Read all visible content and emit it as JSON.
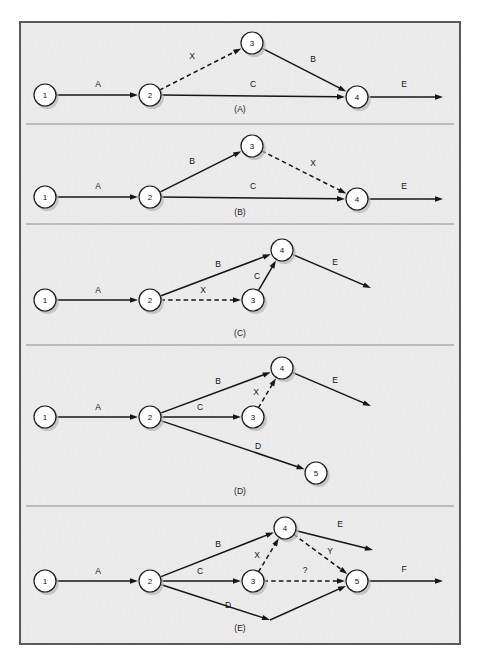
{
  "figure": {
    "background_color": "#ffffff",
    "frame": {
      "fill_color": "#ececec",
      "border_color": "#5a5a5a",
      "x": 20,
      "y": 22,
      "width": 440,
      "height": 622
    },
    "ink_color": "#161616",
    "node_fill_color": "#ffffff",
    "node_stroke_color": "#1c1c1c",
    "divider_color": "#8d8d8d",
    "node_radius": 11,
    "dividers_y": [
      124,
      224,
      345,
      506
    ]
  },
  "chart_data": {
    "type": "diagram",
    "diagram_kind": "activity-on-arrow-network",
    "panel_count": 5,
    "legend": {
      "solid_arrow": "real activity",
      "dashed_arrow": "dummy activity"
    },
    "panels": [
      {
        "id": "A",
        "caption": "(A)",
        "caption_pos": {
          "x": 240,
          "y": 110
        },
        "nodes": [
          {
            "id": "1",
            "label": "1",
            "x": 45,
            "y": 95
          },
          {
            "id": "2",
            "label": "2",
            "x": 150,
            "y": 95
          },
          {
            "id": "3",
            "label": "3",
            "x": 252,
            "y": 43
          },
          {
            "id": "4",
            "label": "4",
            "x": 357,
            "y": 97
          }
        ],
        "edges": [
          {
            "from": "1",
            "to": "2",
            "label": "A",
            "style": "solid",
            "label_pos": {
              "x": 98,
              "y": 85
            }
          },
          {
            "from": "2",
            "to": "3",
            "label": "X",
            "style": "dashed",
            "label_pos": {
              "x": 192,
              "y": 57
            }
          },
          {
            "from": "3",
            "to": "4",
            "label": "B",
            "style": "solid",
            "label_pos": {
              "x": 313,
              "y": 60
            }
          },
          {
            "from": "2",
            "to": "4",
            "label": "C",
            "style": "solid",
            "label_pos": {
              "x": 253,
              "y": 85
            }
          }
        ],
        "open_edges": [
          {
            "from": "4",
            "label": "E",
            "to_x": 443,
            "to_y": 97,
            "style": "solid",
            "label_pos": {
              "x": 404,
              "y": 85
            }
          }
        ]
      },
      {
        "id": "B",
        "caption": "(B)",
        "caption_pos": {
          "x": 240,
          "y": 213
        },
        "nodes": [
          {
            "id": "1",
            "label": "1",
            "x": 45,
            "y": 197
          },
          {
            "id": "2",
            "label": "2",
            "x": 150,
            "y": 197
          },
          {
            "id": "3",
            "label": "3",
            "x": 252,
            "y": 146
          },
          {
            "id": "4",
            "label": "4",
            "x": 357,
            "y": 199
          }
        ],
        "edges": [
          {
            "from": "1",
            "to": "2",
            "label": "A",
            "style": "solid",
            "label_pos": {
              "x": 98,
              "y": 187
            }
          },
          {
            "from": "2",
            "to": "3",
            "label": "B",
            "style": "solid",
            "label_pos": {
              "x": 192,
              "y": 162
            }
          },
          {
            "from": "3",
            "to": "4",
            "label": "X",
            "style": "dashed",
            "label_pos": {
              "x": 313,
              "y": 164
            }
          },
          {
            "from": "2",
            "to": "4",
            "label": "C",
            "style": "solid",
            "label_pos": {
              "x": 253,
              "y": 187
            }
          }
        ],
        "open_edges": [
          {
            "from": "4",
            "label": "E",
            "to_x": 443,
            "to_y": 199,
            "style": "solid",
            "label_pos": {
              "x": 404,
              "y": 187
            }
          }
        ]
      },
      {
        "id": "C",
        "caption": "(C)",
        "caption_pos": {
          "x": 240,
          "y": 334
        },
        "nodes": [
          {
            "id": "1",
            "label": "1",
            "x": 45,
            "y": 300
          },
          {
            "id": "2",
            "label": "2",
            "x": 150,
            "y": 300
          },
          {
            "id": "3",
            "label": "3",
            "x": 253,
            "y": 300
          },
          {
            "id": "4",
            "label": "4",
            "x": 282,
            "y": 250
          }
        ],
        "edges": [
          {
            "from": "1",
            "to": "2",
            "label": "A",
            "style": "solid",
            "label_pos": {
              "x": 98,
              "y": 291
            }
          },
          {
            "from": "2",
            "to": "3",
            "label": "X",
            "style": "dashed",
            "label_pos": {
              "x": 203,
              "y": 291
            }
          },
          {
            "from": "2",
            "to": "4",
            "label": "B",
            "style": "solid",
            "label_pos": {
              "x": 218,
              "y": 265
            }
          },
          {
            "from": "3",
            "to": "4",
            "label": "C",
            "style": "solid",
            "label_pos": {
              "x": 257,
              "y": 277
            }
          }
        ],
        "open_edges": [
          {
            "from": "4",
            "label": "E",
            "to_x": 371,
            "to_y": 288,
            "style": "solid",
            "label_pos": {
              "x": 335,
              "y": 263
            }
          }
        ]
      },
      {
        "id": "D",
        "caption": "(D)",
        "caption_pos": {
          "x": 240,
          "y": 492
        },
        "nodes": [
          {
            "id": "1",
            "label": "1",
            "x": 45,
            "y": 417
          },
          {
            "id": "2",
            "label": "2",
            "x": 150,
            "y": 417
          },
          {
            "id": "3",
            "label": "3",
            "x": 253,
            "y": 417
          },
          {
            "id": "4",
            "label": "4",
            "x": 282,
            "y": 368
          },
          {
            "id": "5",
            "label": "5",
            "x": 316,
            "y": 473
          }
        ],
        "edges": [
          {
            "from": "1",
            "to": "2",
            "label": "A",
            "style": "solid",
            "label_pos": {
              "x": 98,
              "y": 408
            }
          },
          {
            "from": "2",
            "to": "4",
            "label": "B",
            "style": "solid",
            "label_pos": {
              "x": 218,
              "y": 382
            }
          },
          {
            "from": "2",
            "to": "3",
            "label": "C",
            "style": "solid",
            "label_pos": {
              "x": 200,
              "y": 408
            }
          },
          {
            "from": "3",
            "to": "4",
            "label": "X",
            "style": "dashed",
            "label_pos": {
              "x": 256,
              "y": 393
            }
          },
          {
            "from": "2",
            "to": "5",
            "label": "D",
            "style": "solid",
            "label_pos": {
              "x": 258,
              "y": 447
            }
          }
        ],
        "open_edges": [
          {
            "from": "4",
            "label": "E",
            "to_x": 371,
            "to_y": 406,
            "style": "solid",
            "label_pos": {
              "x": 335,
              "y": 381
            }
          }
        ]
      },
      {
        "id": "E",
        "caption": "(E)",
        "caption_pos": {
          "x": 240,
          "y": 629
        },
        "nodes": [
          {
            "id": "1",
            "label": "1",
            "x": 45,
            "y": 581
          },
          {
            "id": "2",
            "label": "2",
            "x": 150,
            "y": 581
          },
          {
            "id": "3",
            "label": "3",
            "x": 253,
            "y": 581
          },
          {
            "id": "4",
            "label": "4",
            "x": 285,
            "y": 528
          },
          {
            "id": "5",
            "label": "5",
            "x": 357,
            "y": 581
          }
        ],
        "edges": [
          {
            "from": "1",
            "to": "2",
            "label": "A",
            "style": "solid",
            "label_pos": {
              "x": 98,
              "y": 572
            }
          },
          {
            "from": "2",
            "to": "4",
            "label": "B",
            "style": "solid",
            "label_pos": {
              "x": 218,
              "y": 545
            }
          },
          {
            "from": "2",
            "to": "3",
            "label": "C",
            "style": "solid",
            "label_pos": {
              "x": 200,
              "y": 572
            }
          },
          {
            "from": "3",
            "to": "4",
            "label": "X",
            "style": "dashed",
            "label_pos": {
              "x": 257,
              "y": 556
            }
          },
          {
            "from": "4",
            "to": "5",
            "label": "Y",
            "style": "dashed",
            "label_pos": {
              "x": 330,
              "y": 552
            }
          },
          {
            "from": "3",
            "to": "5",
            "label": "?",
            "style": "dashed",
            "label_pos": {
              "x": 305,
              "y": 571
            }
          }
        ],
        "bent_edges": [
          {
            "from": "2",
            "to": "5",
            "label": "D",
            "style": "solid",
            "bend_x": 270,
            "bend_y": 620,
            "label_pos": {
              "x": 228,
              "y": 606
            }
          }
        ],
        "open_edges": [
          {
            "from": "4",
            "label": "E",
            "to_x": 373,
            "to_y": 550,
            "style": "solid",
            "label_pos": {
              "x": 340,
              "y": 525
            }
          },
          {
            "from": "5",
            "label": "F",
            "to_x": 443,
            "to_y": 581,
            "style": "solid",
            "label_pos": {
              "x": 404,
              "y": 570
            }
          }
        ]
      }
    ]
  }
}
